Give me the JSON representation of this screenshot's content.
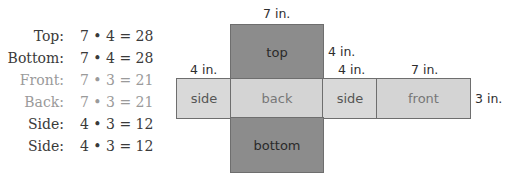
{
  "calculations": [
    {
      "label": "Top:",
      "expression": "7 • 4 = 28",
      "style": "dark"
    },
    {
      "label": "Bottom:",
      "expression": "7 • 4 = 28",
      "style": "dark"
    },
    {
      "label": "Front:",
      "expression": "7 • 3 = 21",
      "style": "light"
    },
    {
      "label": "Back:",
      "expression": "7 • 3 = 21",
      "style": "light"
    },
    {
      "label": "Side:",
      "expression": "4 • 3 = 12",
      "style": "dark"
    },
    {
      "label": "Side:",
      "expression": "4 • 3 = 12",
      "style": "dark"
    }
  ],
  "net": {
    "faces": {
      "top": "top",
      "bottom": "bottom",
      "side_left": "side",
      "back": "back",
      "side_right": "side",
      "front": "front"
    },
    "dimensions": {
      "top_width": "7 in.",
      "top_height": "4 in.",
      "side_left_width": "4 in.",
      "side_right_width": "4 in.",
      "front_width": "7 in.",
      "strip_height": "3 in."
    },
    "colors": {
      "dark_face": "#8c8c8c",
      "light_face": "#d6d6d6",
      "border": "#6e6e6e"
    }
  }
}
